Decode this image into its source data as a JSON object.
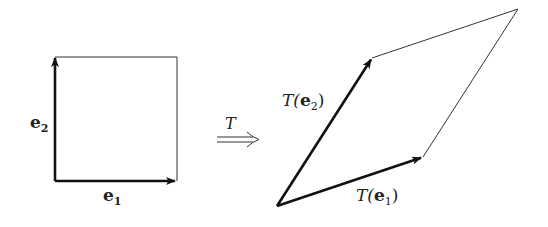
{
  "diagram": {
    "square": {
      "corners": {
        "origin": [
          55,
          181
        ],
        "e1_tip": [
          177,
          181
        ],
        "e2_tip": [
          55,
          57
        ],
        "far": [
          177,
          57
        ]
      },
      "labels": {
        "e1": "e",
        "e1_sub": "1",
        "e2": "e",
        "e2_sub": "2"
      }
    },
    "map_arrow": {
      "label": "T",
      "symbol": "⟹"
    },
    "parallelogram": {
      "corners": {
        "origin": [
          277,
          206
        ],
        "Te1_tip": [
          423,
          157
        ],
        "Te2_tip": [
          372,
          58
        ],
        "far": [
          518,
          9
        ]
      },
      "labels": {
        "Te1_prefix": "T(",
        "Te1_vec": "e",
        "Te1_sub": "1",
        "Te1_suffix": ")",
        "Te2_prefix": "T(",
        "Te2_vec": "e",
        "Te2_sub": "2",
        "Te2_suffix": ")"
      }
    },
    "colors": {
      "line": "#111111",
      "thin_line": "#333333",
      "text": "#222222"
    }
  }
}
